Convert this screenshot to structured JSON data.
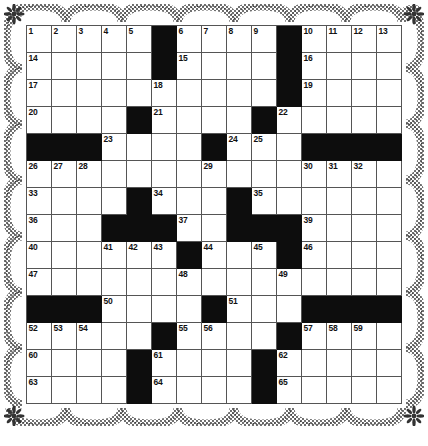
{
  "document": {
    "type": "crossword-puzzle-grid",
    "title": "",
    "background_color": "#ffffff",
    "ink_color": "#111111"
  },
  "border": {
    "style": "scalloped-lace-decorative-frame",
    "color": "#2b2b2b",
    "corner_ornament": "flower-rosette",
    "scallops_top": 7,
    "scallops_bottom": 7,
    "scallops_left": 7,
    "scallops_right": 7
  },
  "grid": {
    "columns": 15,
    "rows": 14,
    "cell_size_px": 25,
    "grid_line_color": "#555555",
    "block_color": "#0d0d0d",
    "empty_color": "#ffffff",
    "blocks": [
      [
        1,
        6
      ],
      [
        1,
        11
      ],
      [
        2,
        6
      ],
      [
        2,
        11
      ],
      [
        3,
        11
      ],
      [
        4,
        5
      ],
      [
        4,
        10
      ],
      [
        5,
        1
      ],
      [
        5,
        2
      ],
      [
        5,
        3
      ],
      [
        5,
        8
      ],
      [
        5,
        12
      ],
      [
        5,
        13
      ],
      [
        5,
        14
      ],
      [
        5,
        15
      ],
      [
        7,
        5
      ],
      [
        7,
        9
      ],
      [
        8,
        4
      ],
      [
        8,
        5
      ],
      [
        8,
        6
      ],
      [
        8,
        9
      ],
      [
        8,
        10
      ],
      [
        8,
        11
      ],
      [
        9,
        7
      ],
      [
        9,
        11
      ],
      [
        11,
        1
      ],
      [
        11,
        2
      ],
      [
        11,
        3
      ],
      [
        11,
        8
      ],
      [
        11,
        12
      ],
      [
        11,
        13
      ],
      [
        11,
        14
      ],
      [
        11,
        15
      ],
      [
        12,
        6
      ],
      [
        12,
        11
      ],
      [
        14,
        5
      ],
      [
        14,
        10
      ],
      [
        13,
        5
      ],
      [
        13,
        10
      ]
    ],
    "numbers": [
      {
        "row": 1,
        "col": 1,
        "n": "1"
      },
      {
        "row": 1,
        "col": 2,
        "n": "2"
      },
      {
        "row": 1,
        "col": 3,
        "n": "3"
      },
      {
        "row": 1,
        "col": 4,
        "n": "4"
      },
      {
        "row": 1,
        "col": 5,
        "n": "5"
      },
      {
        "row": 1,
        "col": 7,
        "n": "6"
      },
      {
        "row": 1,
        "col": 8,
        "n": "7"
      },
      {
        "row": 1,
        "col": 9,
        "n": "8"
      },
      {
        "row": 1,
        "col": 10,
        "n": "9"
      },
      {
        "row": 1,
        "col": 12,
        "n": "10"
      },
      {
        "row": 1,
        "col": 13,
        "n": "11"
      },
      {
        "row": 1,
        "col": 14,
        "n": "12"
      },
      {
        "row": 1,
        "col": 15,
        "n": "13"
      },
      {
        "row": 2,
        "col": 1,
        "n": "14"
      },
      {
        "row": 2,
        "col": 7,
        "n": "15"
      },
      {
        "row": 2,
        "col": 12,
        "n": "16"
      },
      {
        "row": 3,
        "col": 1,
        "n": "17"
      },
      {
        "row": 3,
        "col": 6,
        "n": "18"
      },
      {
        "row": 3,
        "col": 12,
        "n": "19"
      },
      {
        "row": 4,
        "col": 1,
        "n": "20"
      },
      {
        "row": 4,
        "col": 6,
        "n": "21"
      },
      {
        "row": 4,
        "col": 11,
        "n": "22"
      },
      {
        "row": 5,
        "col": 4,
        "n": "23"
      },
      {
        "row": 5,
        "col": 9,
        "n": "24"
      },
      {
        "row": 5,
        "col": 10,
        "n": "25"
      },
      {
        "row": 6,
        "col": 1,
        "n": "26"
      },
      {
        "row": 6,
        "col": 2,
        "n": "27"
      },
      {
        "row": 6,
        "col": 3,
        "n": "28"
      },
      {
        "row": 6,
        "col": 8,
        "n": "29"
      },
      {
        "row": 6,
        "col": 12,
        "n": "30"
      },
      {
        "row": 6,
        "col": 13,
        "n": "31"
      },
      {
        "row": 6,
        "col": 14,
        "n": "32"
      },
      {
        "row": 7,
        "col": 1,
        "n": "33"
      },
      {
        "row": 7,
        "col": 6,
        "n": "34"
      },
      {
        "row": 7,
        "col": 10,
        "n": "35"
      },
      {
        "row": 8,
        "col": 1,
        "n": "36"
      },
      {
        "row": 8,
        "col": 7,
        "n": "37"
      },
      {
        "row": 8,
        "col": 9,
        "n": "38"
      },
      {
        "row": 8,
        "col": 12,
        "n": "39"
      },
      {
        "row": 9,
        "col": 1,
        "n": "40"
      },
      {
        "row": 9,
        "col": 4,
        "n": "41"
      },
      {
        "row": 9,
        "col": 5,
        "n": "42"
      },
      {
        "row": 9,
        "col": 6,
        "n": "43"
      },
      {
        "row": 9,
        "col": 8,
        "n": "44"
      },
      {
        "row": 9,
        "col": 10,
        "n": "45"
      },
      {
        "row": 9,
        "col": 12,
        "n": "46"
      },
      {
        "row": 10,
        "col": 1,
        "n": "47"
      },
      {
        "row": 10,
        "col": 7,
        "n": "48"
      },
      {
        "row": 10,
        "col": 11,
        "n": "49"
      },
      {
        "row": 11,
        "col": 4,
        "n": "50"
      },
      {
        "row": 11,
        "col": 9,
        "n": "51"
      },
      {
        "row": 12,
        "col": 1,
        "n": "52"
      },
      {
        "row": 12,
        "col": 2,
        "n": "53"
      },
      {
        "row": 12,
        "col": 3,
        "n": "54"
      },
      {
        "row": 12,
        "col": 7,
        "n": "55"
      },
      {
        "row": 12,
        "col": 8,
        "n": "56"
      },
      {
        "row": 12,
        "col": 12,
        "n": "57"
      },
      {
        "row": 12,
        "col": 13,
        "n": "58"
      },
      {
        "row": 12,
        "col": 14,
        "n": "59"
      },
      {
        "row": 13,
        "col": 1,
        "n": "60"
      },
      {
        "row": 13,
        "col": 6,
        "n": "61"
      },
      {
        "row": 13,
        "col": 11,
        "n": "62"
      },
      {
        "row": 14,
        "col": 1,
        "n": "63"
      },
      {
        "row": 14,
        "col": 6,
        "n": "64"
      },
      {
        "row": 14,
        "col": 11,
        "n": "65"
      },
      {
        "row": 15,
        "col": 1,
        "n": "66"
      },
      {
        "row": 15,
        "col": 6,
        "n": "67"
      },
      {
        "row": 15,
        "col": 11,
        "n": "68"
      }
    ]
  }
}
